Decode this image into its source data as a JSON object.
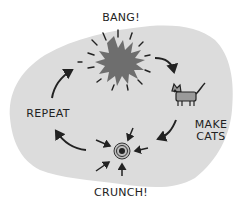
{
  "diagram": {
    "type": "cycle",
    "colors": {
      "background": "#ffffff",
      "blob": "#dcdcdc",
      "ink": "#222222",
      "bang_fill": "#6e6e6e",
      "cat_fill": "#9a9a9a"
    },
    "nodes": [
      {
        "id": "bang",
        "label": "BANG!",
        "icon": "explosion-icon"
      },
      {
        "id": "make_cats",
        "label": "MAKE\nCATS",
        "icon": "cat-icon"
      },
      {
        "id": "crunch",
        "label": "CRUNCH!",
        "icon": "collapse-point-icon"
      },
      {
        "id": "repeat",
        "label": "REPEAT",
        "icon": null
      }
    ],
    "edges": [
      {
        "from": "bang",
        "to": "make_cats"
      },
      {
        "from": "make_cats",
        "to": "crunch"
      },
      {
        "from": "crunch",
        "to": "repeat"
      },
      {
        "from": "repeat",
        "to": "bang"
      }
    ]
  },
  "labels": {
    "bang": "BANG!",
    "make_cats": "MAKE\nCATS",
    "crunch": "CRUNCH!",
    "repeat": "REPEAT"
  }
}
